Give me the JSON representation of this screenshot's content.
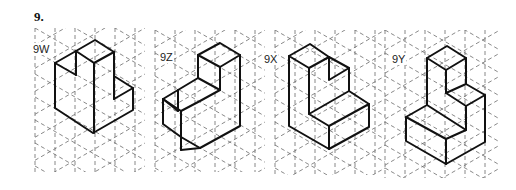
{
  "question": {
    "number": "9."
  },
  "figures": [
    {
      "id": "9W",
      "label": "9W",
      "label_pos": [
        32,
        43
      ]
    },
    {
      "id": "9Z",
      "label": "9Z",
      "label_pos": [
        159,
        51
      ]
    },
    {
      "id": "9X",
      "label": "9X",
      "label_pos": [
        263,
        53
      ]
    },
    {
      "id": "9Y",
      "label": "9Y",
      "label_pos": [
        391,
        53
      ]
    }
  ],
  "grid": {
    "style": "isometric dashed",
    "color": "#6b6b6b",
    "column_spacing_px": 20,
    "regions": [
      {
        "x0": 35,
        "x1": 145,
        "y0": 28,
        "y1": 172
      },
      {
        "x0": 155,
        "x1": 265,
        "y0": 30,
        "y1": 172
      },
      {
        "x0": 275,
        "x1": 385,
        "y0": 30,
        "y1": 175
      },
      {
        "x0": 385,
        "x1": 500,
        "y0": 30,
        "y1": 178
      }
    ]
  },
  "shapes": {
    "stroke_color": "#111111",
    "9W": [
      [
        [
          55,
          63
        ],
        [
          76,
          51
        ],
        [
          95,
          40
        ],
        [
          114,
          52
        ],
        [
          94,
          63
        ],
        [
          76,
          51
        ]
      ],
      [
        [
          55,
          63
        ],
        [
          76,
          75
        ]
      ],
      [
        [
          76,
          51
        ],
        [
          76,
          75
        ]
      ],
      [
        [
          55,
          63
        ],
        [
          55,
          108
        ],
        [
          93,
          133
        ],
        [
          133,
          110
        ],
        [
          133,
          88
        ],
        [
          114,
          76
        ],
        [
          114,
          52
        ]
      ],
      [
        [
          94,
          63
        ],
        [
          94,
          133
        ]
      ],
      [
        [
          114,
          99
        ],
        [
          133,
          88
        ]
      ],
      [
        [
          114,
          76
        ],
        [
          114,
          99
        ]
      ]
    ],
    "9Z": [
      [
        [
          198,
          55
        ],
        [
          220,
          43
        ],
        [
          240,
          55
        ],
        [
          220,
          67
        ],
        [
          198,
          55
        ]
      ],
      [
        [
          198,
          55
        ],
        [
          198,
          78
        ],
        [
          178,
          90
        ],
        [
          163,
          99
        ],
        [
          181,
          111
        ],
        [
          181,
          150
        ]
      ],
      [
        [
          220,
          67
        ],
        [
          220,
          90
        ],
        [
          200,
          101
        ],
        [
          181,
          111
        ]
      ],
      [
        [
          240,
          55
        ],
        [
          240,
          126
        ],
        [
          200,
          148
        ],
        [
          181,
          150
        ]
      ],
      [
        [
          163,
          99
        ],
        [
          163,
          124
        ],
        [
          181,
          137
        ],
        [
          200,
          148
        ]
      ],
      [
        [
          178,
          90
        ],
        [
          178,
          111
        ]
      ],
      [
        [
          163,
          99
        ],
        [
          178,
          111
        ]
      ],
      [
        [
          198,
          78
        ],
        [
          220,
          90
        ]
      ]
    ],
    "9X": [
      [
        [
          289,
          56
        ],
        [
          310,
          44
        ],
        [
          329,
          57
        ],
        [
          309,
          68
        ],
        [
          289,
          56
        ]
      ],
      [
        [
          289,
          56
        ],
        [
          289,
          126
        ],
        [
          329,
          149
        ],
        [
          329,
          126
        ],
        [
          309,
          114
        ],
        [
          349,
          91
        ],
        [
          349,
          68
        ],
        [
          329,
          57
        ]
      ],
      [
        [
          309,
          68
        ],
        [
          309,
          114
        ]
      ],
      [
        [
          329,
          57
        ],
        [
          329,
          80
        ],
        [
          349,
          68
        ]
      ],
      [
        [
          329,
          126
        ],
        [
          369,
          104
        ],
        [
          369,
          127
        ],
        [
          329,
          149
        ]
      ],
      [
        [
          369,
          104
        ],
        [
          349,
          91
        ]
      ]
    ],
    "9Y": [
      [
        [
          427,
          58
        ],
        [
          447,
          46
        ],
        [
          466,
          58
        ],
        [
          446,
          70
        ],
        [
          427,
          58
        ]
      ],
      [
        [
          427,
          58
        ],
        [
          427,
          105
        ],
        [
          406,
          117
        ],
        [
          446,
          139
        ],
        [
          446,
          164
        ],
        [
          485,
          142
        ],
        [
          485,
          95
        ],
        [
          466,
          84
        ],
        [
          466,
          58
        ]
      ],
      [
        [
          446,
          70
        ],
        [
          446,
          93
        ],
        [
          466,
          84
        ]
      ],
      [
        [
          446,
          93
        ],
        [
          466,
          106
        ],
        [
          485,
          95
        ]
      ],
      [
        [
          466,
          106
        ],
        [
          466,
          130
        ],
        [
          446,
          139
        ]
      ],
      [
        [
          406,
          117
        ],
        [
          406,
          141
        ],
        [
          446,
          164
        ]
      ],
      [
        [
          427,
          105
        ],
        [
          466,
          130
        ]
      ]
    ]
  }
}
